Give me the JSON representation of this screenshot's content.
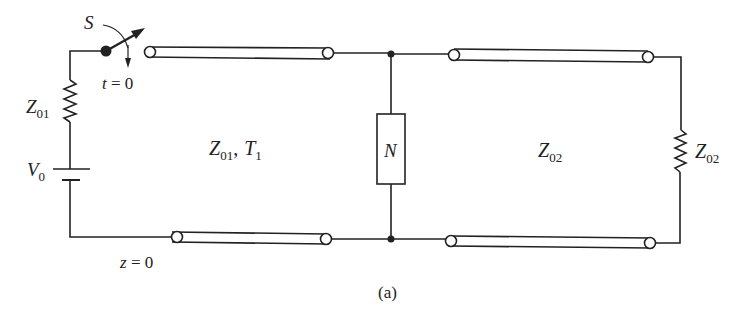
{
  "diagram": {
    "caption": "(a)",
    "source": {
      "switch_label": "S",
      "switch_time_label": "t = 0",
      "resistor_label_main": "Z",
      "resistor_label_sub": "01",
      "battery_label_main": "V",
      "battery_label_sub": "0",
      "position_label": "z = 0"
    },
    "line1": {
      "impedance_main": "Z",
      "impedance_sub": "01",
      "delay_main": "T",
      "delay_sub": "1",
      "separator": ","
    },
    "network": {
      "label": "N"
    },
    "line2": {
      "impedance_main": "Z",
      "impedance_sub": "02"
    },
    "load": {
      "label_main": "Z",
      "label_sub": "02"
    }
  }
}
